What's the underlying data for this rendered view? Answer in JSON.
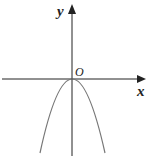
{
  "diagram": {
    "type": "function graph",
    "labels": {
      "y_axis": "y",
      "x_axis": "x",
      "origin": "O"
    },
    "curve": "downward-opening parabola with vertex at origin",
    "colors": {
      "axes": "#222222",
      "curve": "#666666"
    }
  }
}
